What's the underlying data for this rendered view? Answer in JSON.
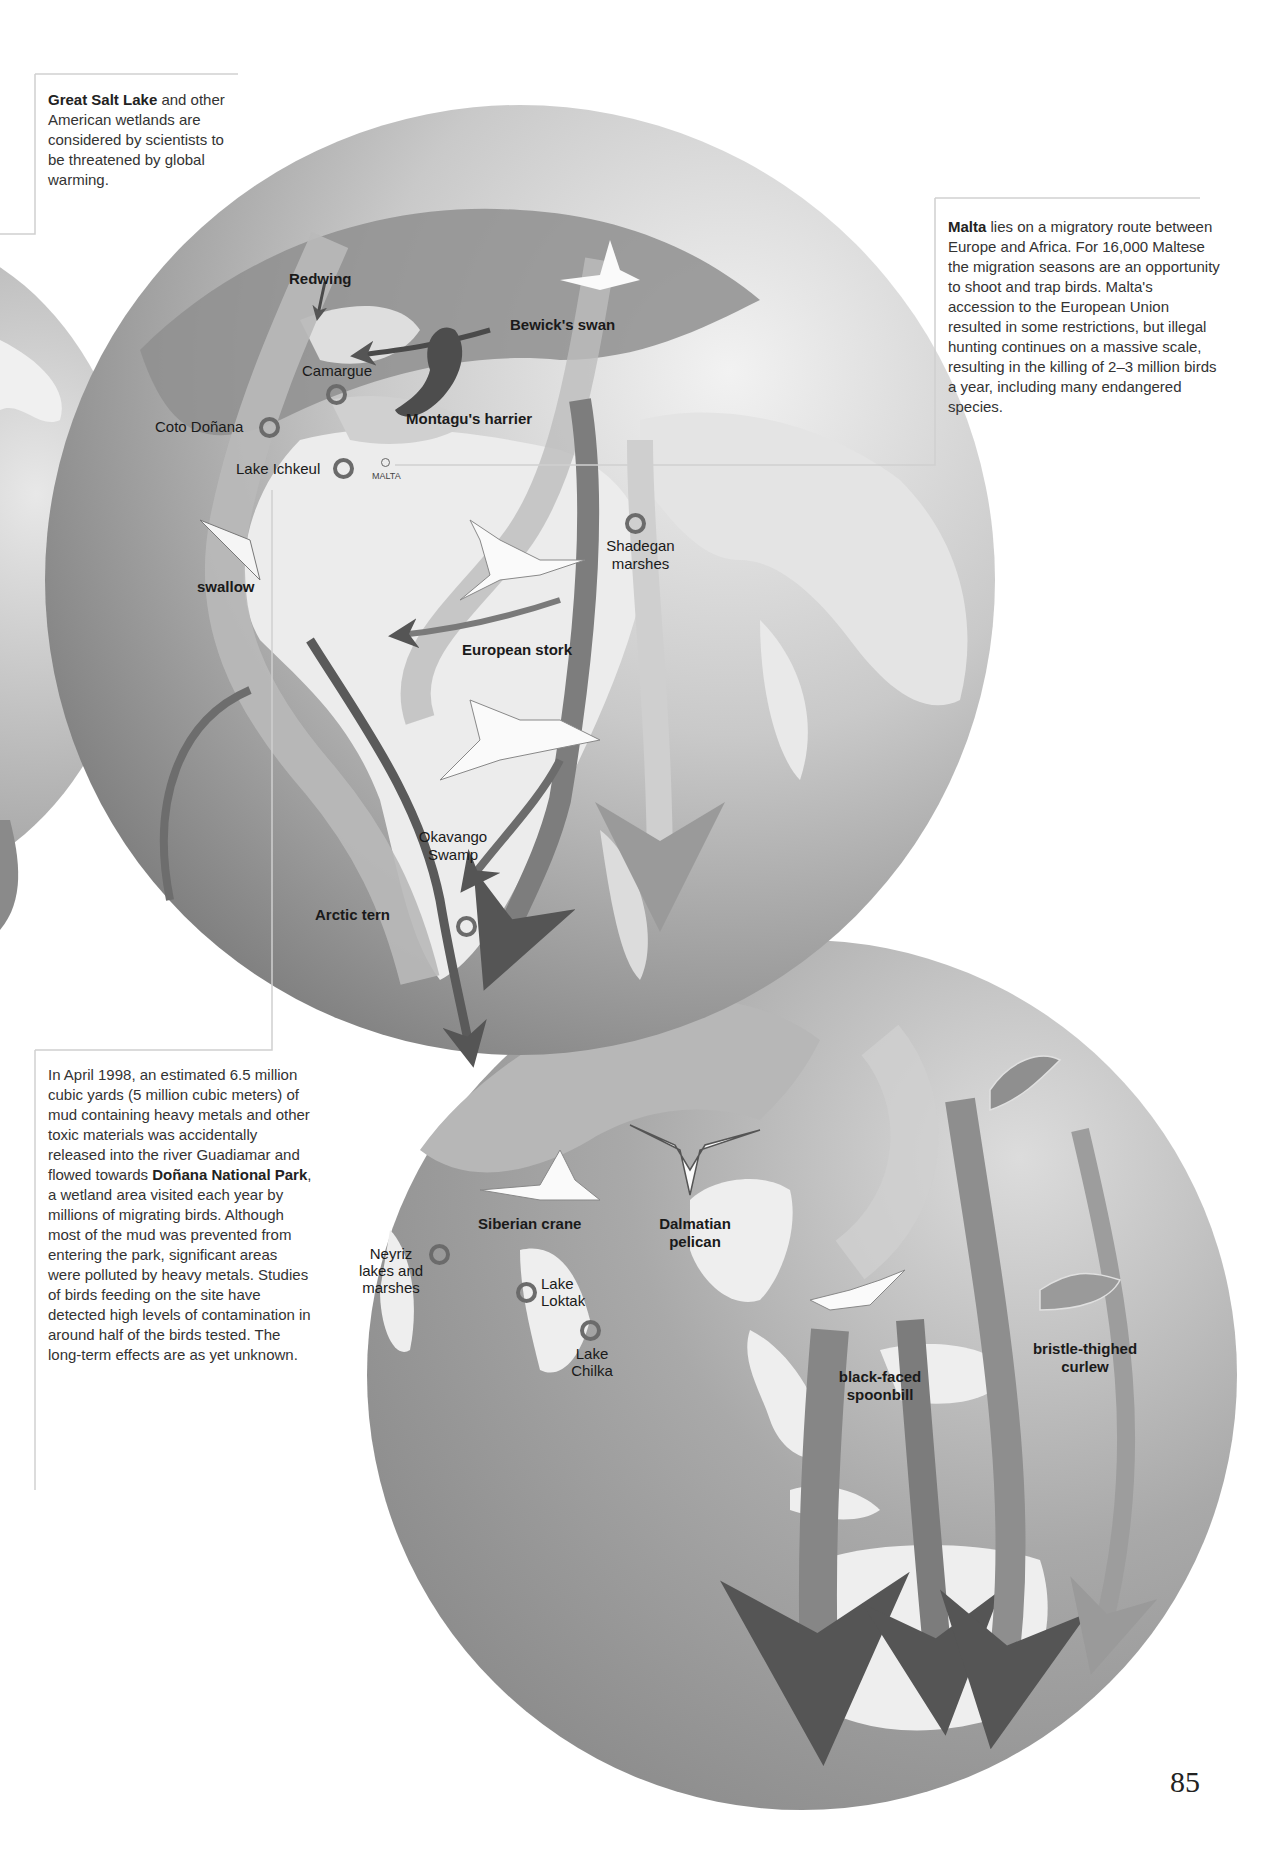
{
  "page": {
    "number": "85",
    "accent_colors": {
      "globe_light": "#e6e6e6",
      "globe_mid": "#a8a8a8",
      "globe_dark": "#7e7e7e",
      "route_dark": "#555555",
      "site_ring": "#6b6b6b"
    }
  },
  "callouts": {
    "great_salt_lake": {
      "bold": "Great Salt Lake",
      "text": " and other American wetlands are considered by scientists to be threatened by global warming."
    },
    "malta": {
      "bold": "Malta",
      "text": " lies on a migratory route between Europe and Africa. For 16,000 Maltese the migration seasons are an opportunity to shoot and trap birds. Malta's accession to the European Union resulted in some restrictions, but illegal hunting continues on a massive scale, resulting in the killing of 2–3 million birds a year, including many endangered species."
    },
    "donana": {
      "text_before": "In April 1998, an estimated 6.5 million cubic yards (5 million cubic meters) of mud containing heavy metals and other toxic materials was accidentally released into the river Guadiamar and flowed towards ",
      "bold": "Doñana National Park",
      "text_after": ", a wetland area visited each year by millions of migrating birds. Although most of the mud was prevented from entering the park, significant areas were polluted by heavy metals. Studies of birds feeding on the site have detected high levels of contamination in around half of the birds tested. The long-term effects are as yet unknown."
    }
  },
  "map_upper": {
    "birds": [
      {
        "name": "Redwing"
      },
      {
        "name": "Bewick's swan"
      },
      {
        "name": "Montagu's harrier"
      },
      {
        "name": "swallow"
      },
      {
        "name": "European stork"
      },
      {
        "name": "Arctic tern"
      }
    ],
    "sites": [
      {
        "name": "Camargue"
      },
      {
        "name": "Coto Doñana"
      },
      {
        "name": "Lake Ichkeul"
      },
      {
        "name": "MALTA"
      },
      {
        "name": "Shadegan marshes"
      },
      {
        "name": "Okavango Swamp"
      }
    ]
  },
  "map_lower": {
    "birds": [
      {
        "name": "Siberian crane"
      },
      {
        "name": "Dalmatian pelican"
      },
      {
        "name": "black-faced spoonbill"
      },
      {
        "name": "bristle-thighed curlew"
      }
    ],
    "sites": [
      {
        "name": "Neyriz lakes and marshes"
      },
      {
        "name": "Lake Loktak"
      },
      {
        "name": "Lake Chilka"
      }
    ]
  }
}
